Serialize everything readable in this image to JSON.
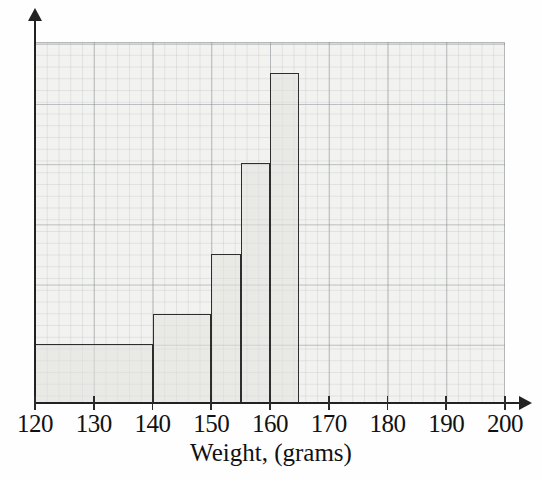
{
  "figure": {
    "kind": "histogram",
    "background_color": "#fefefe",
    "plot_background_color": "#f2f2f0",
    "bar_outline_color": "#2e2e2e",
    "grid_color": "#787d82"
  },
  "axes": {
    "x_title": "Weight, (grams)",
    "x_ticks": [
      "120",
      "130",
      "140",
      "150",
      "160",
      "170",
      "180",
      "190",
      "200"
    ],
    "y_ticks": []
  },
  "chart_data": {
    "type": "bar",
    "title": "",
    "xlabel": "Weight, (grams)",
    "ylabel": "",
    "xlim": [
      120,
      200
    ],
    "ylim": [
      0,
      6
    ],
    "grid": true,
    "legend": "none",
    "tick_labels": [
      "120",
      "130",
      "140",
      "150",
      "160",
      "170",
      "180",
      "190",
      "200"
    ],
    "bins": [
      {
        "label": "120-140",
        "start": 120,
        "end": 140,
        "width": 20,
        "height": 1.0
      },
      {
        "label": "140-150",
        "start": 140,
        "end": 150,
        "width": 10,
        "height": 1.5
      },
      {
        "label": "150-155",
        "start": 150,
        "end": 155,
        "width": 5,
        "height": 2.5
      },
      {
        "label": "155-160",
        "start": 155,
        "end": 160,
        "width": 5,
        "height": 4.0
      },
      {
        "label": "160-165",
        "start": 160,
        "end": 165,
        "width": 5,
        "height": 5.5
      },
      {
        "label": "165-200",
        "start": 165,
        "end": 200,
        "width": 35,
        "height": 0.0
      }
    ],
    "categories": [
      "120-140",
      "140-150",
      "150-155",
      "155-160",
      "160-165",
      "165-200"
    ],
    "values": [
      1.0,
      1.5,
      2.5,
      4.0,
      5.5,
      0.0
    ]
  }
}
